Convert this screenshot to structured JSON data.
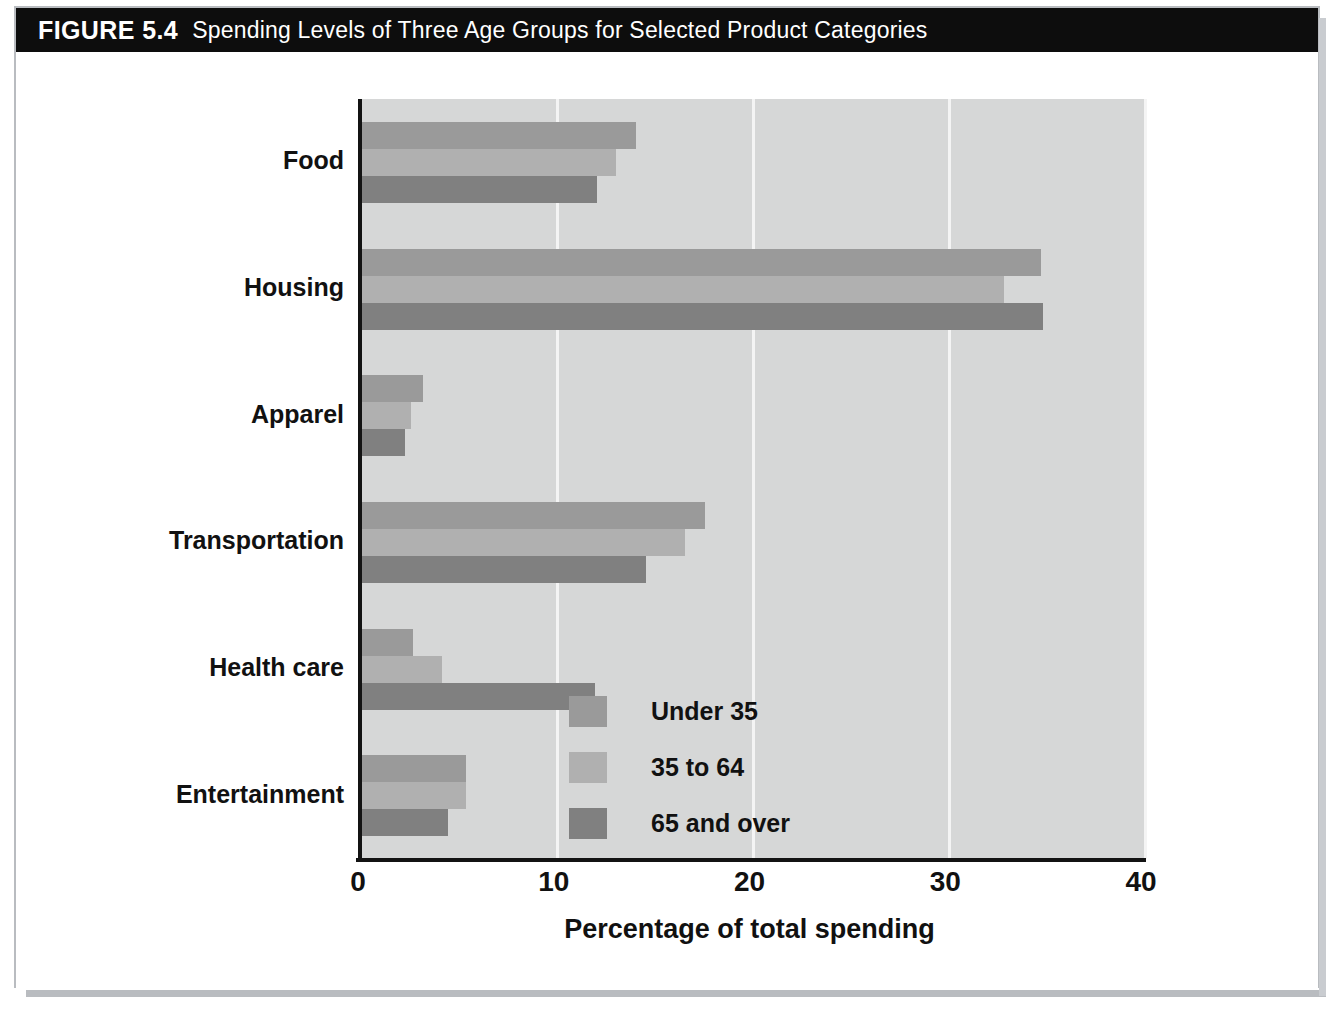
{
  "figure": {
    "number_label": "FIGURE 5.4",
    "title": "Spending Levels of Three Age Groups for Selected Product Categories"
  },
  "chart_data": {
    "type": "bar",
    "orientation": "horizontal",
    "title": "Spending Levels of Three Age Groups for Selected Product Categories",
    "xlabel": "Percentage of total spending",
    "ylabel": "",
    "xlim": [
      0,
      40
    ],
    "xticks": [
      0,
      10,
      20,
      30,
      40
    ],
    "grid": true,
    "grid_axis": "x",
    "legend_position": "inside-right",
    "categories": [
      "Food",
      "Housing",
      "Apparel",
      "Transportation",
      "Health care",
      "Entertainment"
    ],
    "series": [
      {
        "name": "Under 35",
        "color": "#9a9a9a",
        "values": [
          14.0,
          34.7,
          3.1,
          17.5,
          2.6,
          5.3
        ]
      },
      {
        "name": "35 to 64",
        "color": "#b0b0b0",
        "values": [
          13.0,
          32.8,
          2.5,
          16.5,
          4.1,
          5.3
        ]
      },
      {
        "name": "65 and over",
        "color": "#808080",
        "values": [
          12.0,
          34.8,
          2.2,
          14.5,
          11.9,
          4.4
        ]
      }
    ]
  },
  "colors": {
    "title_bar_background": "#0d0d0d",
    "title_bar_text": "#ffffff",
    "plot_background": "#d6d7d7",
    "gridline": "#f4f4f4",
    "axis": "#131313",
    "figure_border": "#b9bcc0"
  }
}
